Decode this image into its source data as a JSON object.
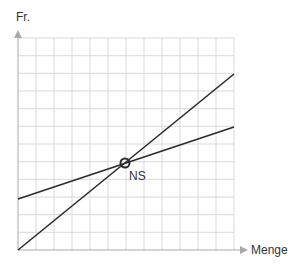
{
  "diagram": {
    "y_axis_label": "Fr.",
    "x_axis_label": "Menge",
    "intersection_label": "NS",
    "colors": {
      "grid": "#d9d9d9",
      "axis": "#aaaaaa",
      "line": "#2b2b2b",
      "text": "#333333"
    },
    "grid": {
      "columns": 12,
      "rows": 12
    },
    "lines": [
      {
        "name": "steep-line",
        "from_cell": [
          0,
          0
        ],
        "to_cell": [
          12,
          10
        ]
      },
      {
        "name": "shallow-line",
        "from_cell": [
          0,
          2.9
        ],
        "to_cell": [
          12,
          7
        ]
      }
    ],
    "intersection_cell": [
      5.9,
      4.9
    ]
  }
}
